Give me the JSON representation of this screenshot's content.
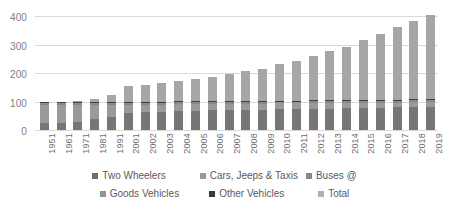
{
  "chart_data": {
    "type": "bar",
    "subtype": "stacked-column",
    "title": "",
    "xlabel": "",
    "ylabel": "",
    "ylim": [
      0,
      400
    ],
    "yticks": [
      0,
      100,
      200,
      300,
      400
    ],
    "grid": true,
    "legend_position": "bottom",
    "categories": [
      "1951",
      "1961",
      "1971",
      "1981",
      "1991",
      "2001",
      "2002",
      "2003",
      "2004",
      "2005",
      "2006",
      "2007",
      "2008",
      "2009",
      "2010",
      "2011",
      "2012",
      "2013",
      "2014",
      "2015",
      "2016",
      "2017",
      "2018",
      "2019"
    ],
    "series": [
      {
        "name": "Two Wheelers",
        "color": "#767676",
        "values": [
          27,
          29,
          33,
          42,
          50,
          63,
          65,
          67,
          69,
          70,
          72,
          73,
          74,
          75,
          76,
          77,
          78,
          79,
          80,
          81,
          82,
          83,
          84,
          85
        ]
      },
      {
        "name": "Cars, Jeeps & Taxis",
        "color": "#9a9a9a",
        "values": [
          67,
          65,
          60,
          52,
          43,
          30,
          28,
          27,
          26,
          25,
          24,
          23,
          23,
          22,
          22,
          21,
          21,
          20,
          20,
          19,
          19,
          18,
          18,
          17
        ]
      },
      {
        "name": "Buses @",
        "color": "#868686",
        "values": [
          2,
          2,
          2,
          2,
          2,
          2,
          2,
          2,
          2,
          2,
          2,
          2,
          2,
          2,
          2,
          2,
          2,
          2,
          2,
          2,
          2,
          2,
          2,
          2
        ]
      },
      {
        "name": "Goods Vehicles",
        "color": "#8e8e8e",
        "values": [
          3,
          3,
          4,
          4,
          4,
          4,
          4,
          4,
          4,
          4,
          4,
          4,
          4,
          4,
          4,
          4,
          4,
          4,
          4,
          4,
          4,
          4,
          4,
          4
        ]
      },
      {
        "name": "Other Vehicles",
        "color": "#3f3f3f",
        "values": [
          3,
          3,
          3,
          3,
          3,
          3,
          3,
          3,
          3,
          3,
          3,
          3,
          3,
          3,
          3,
          3,
          3,
          3,
          3,
          3,
          3,
          3,
          3,
          3
        ]
      },
      {
        "name": "Total",
        "color": "#a6a6a6",
        "values": [
          0,
          0,
          4,
          8,
          23,
          55,
          60,
          65,
          72,
          78,
          85,
          95,
          103,
          112,
          128,
          140,
          155,
          172,
          186,
          210,
          230,
          255,
          275,
          295
        ]
      }
    ],
    "bar_totals": [
      102,
      102,
      106,
      111,
      125,
      157,
      162,
      168,
      176,
      182,
      190,
      200,
      209,
      218,
      235,
      247,
      263,
      280,
      295,
      319,
      340,
      365,
      386,
      406
    ]
  },
  "y_axis": {
    "ticks": [
      "0",
      "100",
      "200",
      "300",
      "400"
    ]
  },
  "legend": {
    "row1": [
      {
        "label": "Two Wheelers",
        "swatch": "two-wheelers"
      },
      {
        "label": "Cars, Jeeps & Taxis",
        "swatch": "cars"
      },
      {
        "label": "Buses @",
        "swatch": "buses"
      }
    ],
    "row2": [
      {
        "label": "Goods Vehicles",
        "swatch": "goods"
      },
      {
        "label": "Other Vehicles",
        "swatch": "other"
      },
      {
        "label": "Total",
        "swatch": "total"
      }
    ]
  },
  "colors": {
    "gridline": "#d9d9d9",
    "axis_text": "#808080",
    "legend_text": "#5a5a5a",
    "background": "#ffffff"
  }
}
